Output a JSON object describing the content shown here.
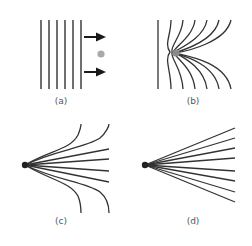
{
  "panels": [
    {
      "id": "a",
      "label": "(a)",
      "description": "Parallel field lines with arrows moving toward a gray particle"
    },
    {
      "id": "b",
      "label": "(b)",
      "description": "Field lines bending and converging onto a point charge"
    },
    {
      "id": "c",
      "label": "(c)",
      "description": "Lines radiating from a point, outer lines curving up and down"
    },
    {
      "id": "d",
      "label": "(d)",
      "description": "Straight lines radiating from a point"
    }
  ],
  "colors": {
    "line": "#333333",
    "particle": "#a9a9a9",
    "arrow": "#1a1a1a",
    "label": "#555555"
  }
}
